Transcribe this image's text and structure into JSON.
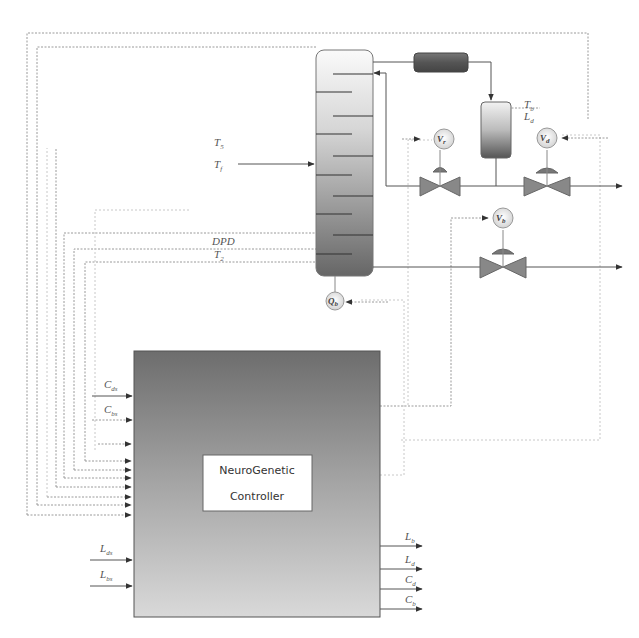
{
  "diagram": {
    "type": "process-control-schematic",
    "controller": {
      "line1": "NeuroGenetic",
      "line2": "Controller"
    },
    "column_inputs": {
      "feed_label_1": "T",
      "feed_label_1_sub": "5",
      "feed_label_2": "T",
      "feed_label_2_sub": "f",
      "dpd": "DPD",
      "t_bottom": "T",
      "t_bottom_sub": "2"
    },
    "accumulator": {
      "t_label": "T",
      "t_sub": "b",
      "l_label": "L",
      "l_sub": "d"
    },
    "valves": [
      {
        "id": "Vr",
        "main": "V",
        "sub": "r"
      },
      {
        "id": "Vd",
        "main": "V",
        "sub": "d"
      },
      {
        "id": "Vb",
        "main": "V",
        "sub": "b"
      }
    ],
    "reboiler": {
      "main": "Q",
      "sub": "b"
    },
    "controller_inputs": [
      {
        "main": "C",
        "sub": "ds"
      },
      {
        "main": "C",
        "sub": "bs"
      },
      {
        "main": "L",
        "sub": "ds"
      },
      {
        "main": "L",
        "sub": "bs"
      }
    ],
    "controller_outputs": [
      {
        "main": "L",
        "sub": "b"
      },
      {
        "main": "L",
        "sub": "d"
      },
      {
        "main": "C",
        "sub": "d"
      },
      {
        "main": "C",
        "sub": "b"
      }
    ]
  }
}
